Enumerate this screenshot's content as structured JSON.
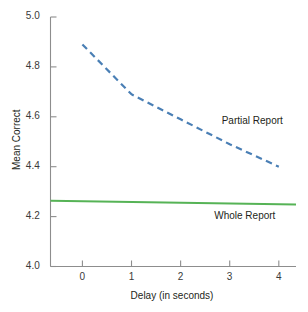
{
  "chart_data": {
    "type": "line",
    "title": "",
    "xlabel": "Delay (in seconds)",
    "ylabel": "Mean Correct",
    "xlim": [
      -0.65,
      4.35
    ],
    "ylim": [
      4.0,
      5.0
    ],
    "xticks": [
      "0",
      "1",
      "2",
      "3",
      "4"
    ],
    "xtick_values": [
      0,
      1,
      2,
      3,
      4
    ],
    "yticks": [
      "4.0",
      "4.2",
      "4.4",
      "4.6",
      "4.8",
      "5.0"
    ],
    "ytick_values": [
      4.0,
      4.2,
      4.4,
      4.6,
      4.8,
      5.0
    ],
    "grid": false,
    "legend_position": "inline-annotation",
    "x": [
      0,
      1,
      2,
      3,
      4
    ],
    "series": [
      {
        "name": "Partial Report",
        "values": [
          4.89,
          4.69,
          4.59,
          4.49,
          4.4
        ],
        "color": "#4a7fb5",
        "style": "dashed",
        "width": 2.2,
        "label_x": 3.0,
        "label_y": 4.58
      },
      {
        "name": "Whole Report",
        "values": [
          4.262,
          4.258,
          4.255,
          4.252,
          4.25
        ],
        "color": "#56b356",
        "style": "solid",
        "width": 2.0,
        "label_x": 2.95,
        "label_y": 4.2
      }
    ]
  },
  "axes": {
    "axis_color": "#8d8d8d",
    "tick_color": "#8d8d8d"
  },
  "colors": {
    "background": "#ffffff",
    "text": "#231f20",
    "partial_report": "#4a7fb5",
    "whole_report": "#56b356",
    "axis": "#8d8d8d"
  }
}
